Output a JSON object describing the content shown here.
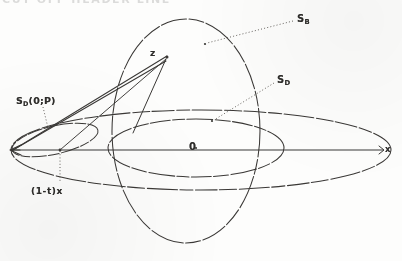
{
  "figure": {
    "kind": "geometric-diagram",
    "stroke_color": "#3a3836",
    "background_color": "#fdfdfc",
    "axis": {
      "name": "horizontal-axis",
      "left_endpoint_label": "x",
      "right_endpoint_label": "x",
      "center_label": "0"
    },
    "labels": {
      "sphere_b": {
        "base": "S",
        "subscript": "B",
        "text": "S_B"
      },
      "sphere_d": {
        "base": "S",
        "subscript": "D",
        "text": "S_D"
      },
      "sphere_d_op": {
        "base": "S",
        "subscript": "D",
        "suffix": "(0;P)",
        "text": "S_D(0;P)"
      },
      "segment": "(1-t)x",
      "origin": "0",
      "point_z": "z",
      "axis_right": "x"
    },
    "top_clipped_text": "CUT OFF HEADER LINE",
    "curves": [
      {
        "name": "outer-flat-ellipse",
        "cx": 201,
        "cy": 150,
        "rx": 193,
        "ry": 40,
        "dashed": true
      },
      {
        "name": "vertical-ellipse-sb",
        "cx": 185,
        "cy": 131,
        "rx": 74,
        "ry": 113,
        "dashed": true
      },
      {
        "name": "inner-horizontal-ellipse-sd",
        "cx": 196,
        "cy": 148,
        "rx": 88,
        "ry": 29,
        "dashed": true
      },
      {
        "name": "narrow-ellipse-sdop",
        "cx": 52,
        "cy": 139,
        "rx": 45,
        "ry": 15,
        "rotation": -14,
        "dashed": true
      }
    ],
    "chords": [
      {
        "name": "chord-x-to-z-upper",
        "from": [
          12,
          150
        ],
        "to": [
          166,
          57
        ]
      },
      {
        "name": "chord-x-to-z-lower",
        "from": [
          12,
          150
        ],
        "to": [
          166,
          60
        ]
      },
      {
        "name": "chord-z-down",
        "from": [
          166,
          58
        ],
        "to": [
          132,
          130
        ]
      }
    ],
    "leaders": [
      {
        "name": "leader-sb",
        "from": [
          294,
          20
        ],
        "to": [
          206,
          44
        ],
        "dotted": true
      },
      {
        "name": "leader-sd",
        "from": [
          275,
          82
        ],
        "to": [
          213,
          121
        ],
        "dotted": true
      },
      {
        "name": "leader-sdop",
        "from": [
          42,
          106
        ],
        "to": [
          48,
          131
        ],
        "dotted": true
      },
      {
        "name": "dropline-1mt",
        "from": [
          60,
          150
        ],
        "to": [
          60,
          184
        ],
        "dotted": true
      }
    ]
  }
}
